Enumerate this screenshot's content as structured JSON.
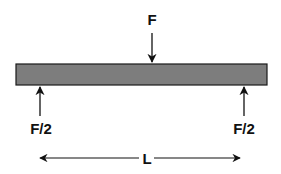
{
  "diagram": {
    "beam": {
      "fill": "#7d7d7d",
      "stroke": "#1a1a1a"
    },
    "labels": {
      "applied_load": "F",
      "left_reaction": "F/2",
      "right_reaction": "F/2",
      "span": "L"
    }
  }
}
